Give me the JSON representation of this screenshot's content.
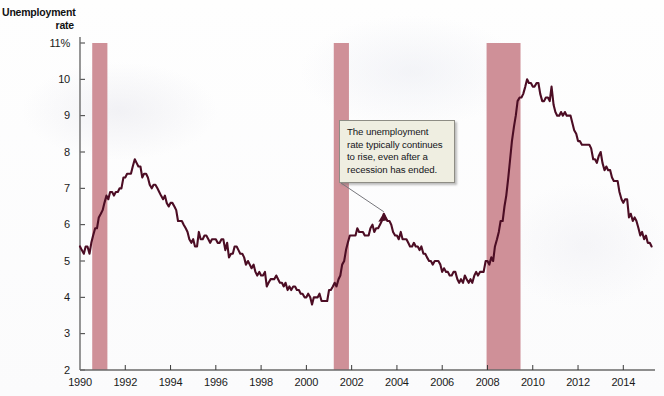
{
  "chart_data": {
    "type": "line",
    "title": "Unemployment rate",
    "ylabel": "Unemployment rate",
    "xlabel": "",
    "ylim": [
      2,
      11
    ],
    "xlim": [
      1990,
      2015.4
    ],
    "y_unit": "percent",
    "y_ticks": [
      2,
      3,
      4,
      5,
      6,
      7,
      8,
      9,
      10,
      11
    ],
    "y_tick_labels": [
      "2",
      "3",
      "4",
      "5",
      "6",
      "7",
      "8",
      "9",
      "10",
      "11%"
    ],
    "x_ticks": [
      1990,
      1992,
      1994,
      1996,
      1998,
      2000,
      2002,
      2004,
      2006,
      2008,
      2010,
      2012,
      2014
    ],
    "x_tick_labels": [
      "1990",
      "1992",
      "1994",
      "1996",
      "1998",
      "2000",
      "2002",
      "2004",
      "2006",
      "2008",
      "2010",
      "2012",
      "2014"
    ],
    "grid": false,
    "legend": "none",
    "line_color": "#4c0d24",
    "recession_band_color": "#cf9098",
    "recession_bands": [
      {
        "start": 1990.54,
        "end": 1991.21,
        "label": "1990-91 recession"
      },
      {
        "start": 2001.21,
        "end": 2001.88,
        "label": "2001 recession"
      },
      {
        "start": 2007.96,
        "end": 2009.46,
        "label": "2007-09 recession"
      }
    ],
    "series": [
      {
        "name": "Unemployment rate",
        "x": [
          1990.0,
          1990.08,
          1990.17,
          1990.25,
          1990.33,
          1990.42,
          1990.5,
          1990.58,
          1990.67,
          1990.75,
          1990.83,
          1990.92,
          1991.0,
          1991.08,
          1991.17,
          1991.25,
          1991.33,
          1991.42,
          1991.5,
          1991.58,
          1991.67,
          1991.75,
          1991.83,
          1991.92,
          1992.0,
          1992.08,
          1992.17,
          1992.25,
          1992.33,
          1992.42,
          1992.5,
          1992.58,
          1992.67,
          1992.75,
          1992.83,
          1992.92,
          1993.0,
          1993.08,
          1993.17,
          1993.25,
          1993.33,
          1993.42,
          1993.5,
          1993.58,
          1993.67,
          1993.75,
          1993.83,
          1993.92,
          1994.0,
          1994.08,
          1994.17,
          1994.25,
          1994.33,
          1994.42,
          1994.5,
          1994.58,
          1994.67,
          1994.75,
          1994.83,
          1994.92,
          1995.0,
          1995.08,
          1995.17,
          1995.25,
          1995.33,
          1995.42,
          1995.5,
          1995.58,
          1995.67,
          1995.75,
          1995.83,
          1995.92,
          1996.0,
          1996.08,
          1996.17,
          1996.25,
          1996.33,
          1996.42,
          1996.5,
          1996.58,
          1996.67,
          1996.75,
          1996.83,
          1996.92,
          1997.0,
          1997.08,
          1997.17,
          1997.25,
          1997.33,
          1997.42,
          1997.5,
          1997.58,
          1997.67,
          1997.75,
          1997.83,
          1997.92,
          1998.0,
          1998.08,
          1998.17,
          1998.25,
          1998.33,
          1998.42,
          1998.5,
          1998.58,
          1998.67,
          1998.75,
          1998.83,
          1998.92,
          1999.0,
          1999.08,
          1999.17,
          1999.25,
          1999.33,
          1999.42,
          1999.5,
          1999.58,
          1999.67,
          1999.75,
          1999.83,
          1999.92,
          2000.0,
          2000.08,
          2000.17,
          2000.25,
          2000.33,
          2000.42,
          2000.5,
          2000.58,
          2000.67,
          2000.75,
          2000.83,
          2000.92,
          2001.0,
          2001.08,
          2001.17,
          2001.25,
          2001.33,
          2001.42,
          2001.5,
          2001.58,
          2001.67,
          2001.75,
          2001.83,
          2001.92,
          2002.0,
          2002.08,
          2002.17,
          2002.25,
          2002.33,
          2002.42,
          2002.5,
          2002.58,
          2002.67,
          2002.75,
          2002.83,
          2002.92,
          2003.0,
          2003.08,
          2003.17,
          2003.25,
          2003.33,
          2003.42,
          2003.5,
          2003.58,
          2003.67,
          2003.75,
          2003.83,
          2003.92,
          2004.0,
          2004.08,
          2004.17,
          2004.25,
          2004.33,
          2004.42,
          2004.5,
          2004.58,
          2004.67,
          2004.75,
          2004.83,
          2004.92,
          2005.0,
          2005.08,
          2005.17,
          2005.25,
          2005.33,
          2005.42,
          2005.5,
          2005.58,
          2005.67,
          2005.75,
          2005.83,
          2005.92,
          2006.0,
          2006.08,
          2006.17,
          2006.25,
          2006.33,
          2006.42,
          2006.5,
          2006.58,
          2006.67,
          2006.75,
          2006.83,
          2006.92,
          2007.0,
          2007.08,
          2007.17,
          2007.25,
          2007.33,
          2007.42,
          2007.5,
          2007.58,
          2007.67,
          2007.75,
          2007.83,
          2007.92,
          2008.0,
          2008.08,
          2008.17,
          2008.25,
          2008.33,
          2008.42,
          2008.5,
          2008.58,
          2008.67,
          2008.75,
          2008.83,
          2008.92,
          2009.0,
          2009.08,
          2009.17,
          2009.25,
          2009.33,
          2009.42,
          2009.5,
          2009.58,
          2009.67,
          2009.75,
          2009.83,
          2009.92,
          2010.0,
          2010.08,
          2010.17,
          2010.25,
          2010.33,
          2010.42,
          2010.5,
          2010.58,
          2010.67,
          2010.75,
          2010.83,
          2010.92,
          2011.0,
          2011.08,
          2011.17,
          2011.25,
          2011.33,
          2011.42,
          2011.5,
          2011.58,
          2011.67,
          2011.75,
          2011.83,
          2011.92,
          2012.0,
          2012.08,
          2012.17,
          2012.25,
          2012.33,
          2012.42,
          2012.5,
          2012.58,
          2012.67,
          2012.75,
          2012.83,
          2012.92,
          2013.0,
          2013.08,
          2013.17,
          2013.25,
          2013.33,
          2013.42,
          2013.5,
          2013.58,
          2013.67,
          2013.75,
          2013.83,
          2013.92,
          2014.0,
          2014.08,
          2014.17,
          2014.25,
          2014.33,
          2014.42,
          2014.5,
          2014.58,
          2014.67,
          2014.75,
          2014.83,
          2014.92,
          2015.0,
          2015.08,
          2015.17,
          2015.25
        ],
        "values": [
          5.4,
          5.3,
          5.2,
          5.4,
          5.4,
          5.2,
          5.5,
          5.7,
          5.9,
          5.9,
          6.2,
          6.3,
          6.4,
          6.6,
          6.8,
          6.7,
          6.9,
          6.9,
          6.8,
          6.9,
          6.9,
          7.0,
          7.0,
          7.3,
          7.3,
          7.4,
          7.4,
          7.4,
          7.6,
          7.8,
          7.7,
          7.6,
          7.6,
          7.3,
          7.4,
          7.4,
          7.3,
          7.1,
          7.0,
          7.1,
          7.1,
          7.0,
          6.9,
          6.8,
          6.7,
          6.8,
          6.6,
          6.5,
          6.6,
          6.6,
          6.5,
          6.4,
          6.1,
          6.1,
          6.1,
          6.0,
          5.9,
          5.8,
          5.6,
          5.5,
          5.6,
          5.4,
          5.4,
          5.8,
          5.6,
          5.6,
          5.7,
          5.7,
          5.6,
          5.5,
          5.6,
          5.6,
          5.6,
          5.5,
          5.5,
          5.6,
          5.6,
          5.3,
          5.5,
          5.1,
          5.2,
          5.2,
          5.4,
          5.4,
          5.3,
          5.2,
          5.2,
          5.1,
          4.9,
          5.0,
          4.9,
          4.8,
          4.9,
          4.7,
          4.6,
          4.7,
          4.6,
          4.6,
          4.7,
          4.3,
          4.4,
          4.5,
          4.5,
          4.5,
          4.6,
          4.5,
          4.4,
          4.4,
          4.3,
          4.4,
          4.2,
          4.3,
          4.2,
          4.3,
          4.3,
          4.2,
          4.2,
          4.1,
          4.1,
          4.0,
          4.0,
          4.1,
          4.0,
          3.8,
          4.0,
          4.0,
          4.0,
          4.1,
          3.9,
          3.9,
          3.9,
          3.9,
          4.2,
          4.2,
          4.3,
          4.4,
          4.3,
          4.5,
          4.6,
          4.9,
          5.0,
          5.3,
          5.5,
          5.7,
          5.7,
          5.7,
          5.7,
          5.9,
          5.8,
          5.8,
          5.8,
          5.7,
          5.7,
          5.7,
          5.9,
          6.0,
          5.8,
          5.9,
          5.9,
          6.0,
          6.1,
          6.3,
          6.2,
          6.1,
          6.1,
          6.0,
          5.8,
          5.7,
          5.7,
          5.6,
          5.8,
          5.6,
          5.6,
          5.6,
          5.5,
          5.4,
          5.4,
          5.5,
          5.4,
          5.4,
          5.3,
          5.4,
          5.2,
          5.2,
          5.1,
          5.0,
          5.0,
          4.9,
          5.0,
          5.0,
          5.0,
          4.9,
          4.7,
          4.8,
          4.7,
          4.7,
          4.6,
          4.6,
          4.7,
          4.7,
          4.5,
          4.4,
          4.5,
          4.4,
          4.6,
          4.5,
          4.4,
          4.5,
          4.4,
          4.6,
          4.7,
          4.6,
          4.7,
          4.7,
          4.7,
          5.0,
          5.0,
          4.9,
          5.1,
          5.0,
          5.4,
          5.6,
          5.8,
          6.1,
          6.1,
          6.5,
          6.8,
          7.3,
          7.8,
          8.3,
          8.7,
          9.0,
          9.4,
          9.5,
          9.5,
          9.6,
          9.8,
          10.0,
          9.9,
          9.9,
          9.8,
          9.8,
          9.9,
          9.9,
          9.6,
          9.4,
          9.4,
          9.5,
          9.5,
          9.4,
          9.8,
          9.3,
          9.1,
          9.0,
          9.0,
          9.1,
          9.0,
          9.1,
          9.0,
          9.0,
          9.0,
          8.8,
          8.6,
          8.5,
          8.3,
          8.3,
          8.2,
          8.2,
          8.2,
          8.2,
          8.2,
          8.1,
          7.8,
          7.8,
          7.7,
          7.9,
          8.0,
          7.7,
          7.5,
          7.6,
          7.5,
          7.5,
          7.3,
          7.2,
          7.2,
          7.2,
          6.9,
          6.7,
          6.6,
          6.7,
          6.7,
          6.2,
          6.3,
          6.1,
          6.2,
          6.1,
          5.9,
          5.7,
          5.8,
          5.6,
          5.7,
          5.5,
          5.5,
          5.4
        ]
      }
    ],
    "annotations": [
      {
        "text": "The unemployment rate typically continues to rise, even after a recession has ended.",
        "x": 2003.42,
        "y": 6.3
      }
    ]
  },
  "callout": {
    "line1": "The unemployment",
    "line2": "rate typically continues",
    "line3": "to rise, even after a",
    "line4": "recession has ended."
  }
}
